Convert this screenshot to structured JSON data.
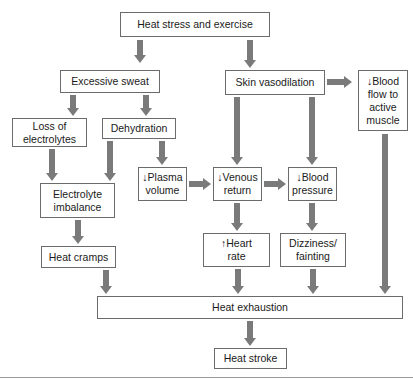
{
  "diagram": {
    "arrow_color": "#7a7a7a",
    "border_color": "#6b6b6b",
    "nodes": {
      "heat_stress": "Heat stress and exercise",
      "excessive_sweat": "Excessive sweat",
      "skin_vasodilation": "Skin vasodilation",
      "blood_flow": "↓Blood\nflow to\nactive\nmuscle",
      "loss_electrolytes": "Loss of\nelectrolytes",
      "dehydration": "Dehydration",
      "plasma_volume": "↓Plasma\nvolume",
      "venous_return": "↓Venous\nreturn",
      "blood_pressure": "↓Blood\npressure",
      "electrolyte_imbalance": "Electrolyte\nimbalance",
      "heat_cramps": "Heat cramps",
      "heart_rate": "↑Heart\nrate",
      "dizziness": "Dizziness/\nfainting",
      "heat_exhaustion": "Heat exhaustion",
      "heat_stroke": "Heat stroke"
    },
    "edges": [
      [
        "heat_stress",
        "excessive_sweat"
      ],
      [
        "heat_stress",
        "skin_vasodilation"
      ],
      [
        "skin_vasodilation",
        "blood_flow"
      ],
      [
        "excessive_sweat",
        "loss_electrolytes"
      ],
      [
        "excessive_sweat",
        "dehydration"
      ],
      [
        "skin_vasodilation",
        "venous_return"
      ],
      [
        "skin_vasodilation",
        "blood_pressure"
      ],
      [
        "loss_electrolytes",
        "electrolyte_imbalance"
      ],
      [
        "dehydration",
        "electrolyte_imbalance"
      ],
      [
        "dehydration",
        "plasma_volume"
      ],
      [
        "plasma_volume",
        "venous_return"
      ],
      [
        "venous_return",
        "blood_pressure"
      ],
      [
        "electrolyte_imbalance",
        "heat_cramps"
      ],
      [
        "venous_return",
        "heart_rate"
      ],
      [
        "blood_pressure",
        "dizziness"
      ],
      [
        "heat_cramps",
        "heat_exhaustion"
      ],
      [
        "heart_rate",
        "heat_exhaustion"
      ],
      [
        "dizziness",
        "heat_exhaustion"
      ],
      [
        "blood_flow",
        "heat_exhaustion"
      ],
      [
        "heat_exhaustion",
        "heat_stroke"
      ]
    ]
  }
}
